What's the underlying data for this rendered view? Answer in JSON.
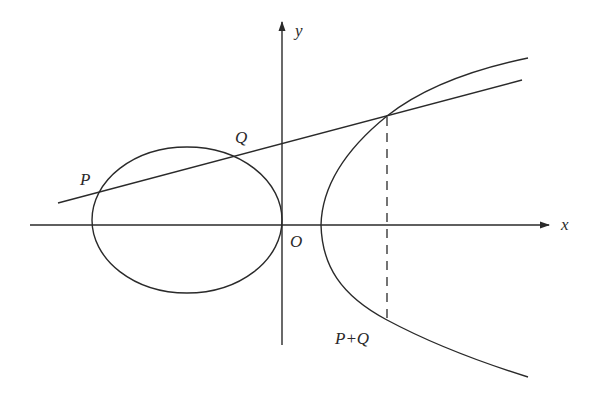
{
  "diagram": {
    "labels": {
      "x_axis": "x",
      "y_axis": "y",
      "origin": "O",
      "point_p": "P",
      "point_q": "Q",
      "point_sum": "P+Q"
    },
    "colors": {
      "stroke": "#2a2a2a",
      "background": "#ffffff"
    },
    "elements": [
      "x-axis with arrow",
      "y-axis with arrow",
      "closed oval component (left of y-axis, touching origin)",
      "unbounded branch (right of origin)",
      "secant line through P and Q",
      "dashed vertical line to reflected point P+Q"
    ]
  }
}
